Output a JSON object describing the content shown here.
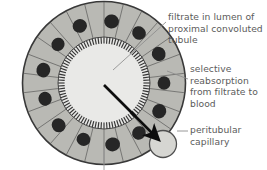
{
  "figure": {
    "type": "biology-diagram",
    "background_color": "#ffffff",
    "text_color": "#5b5b5b"
  },
  "diagram": {
    "tubule": {
      "name": "proximal convoluted tubule",
      "outline_color": "#3c3c3c",
      "cytoplasm_color": "#b9b9b4",
      "nucleus_color": "#2e2e2e",
      "mitochondria_color": "#4a4a4a",
      "center_x": 104,
      "center_y": 83,
      "outer_radius": 82,
      "inner_radius": 46,
      "cell_count": 26,
      "nucleus_count": 13
    },
    "lumen": {
      "name": "lumen",
      "fill_color": "#e8e8e6",
      "radius": 46,
      "brush_border_color": "#2b2b2b",
      "brush_border_ticks": 96
    },
    "capillary": {
      "name": "peritubular capillary",
      "center_x": 163,
      "center_y": 144,
      "radius": 14,
      "fill_color": "#d4d4d0",
      "outline_color": "#555555"
    },
    "arrow": {
      "name": "selective-reabsorption-arrow",
      "color": "#0d0d0d",
      "from_x": 104,
      "from_y": 85,
      "to_x": 160,
      "to_y": 141
    },
    "leaders": [
      {
        "name": "leader-filtrate",
        "color": "#8d8d8d",
        "x1": 166,
        "y1": 22,
        "x2": 113,
        "y2": 70
      },
      {
        "name": "leader-reabsorption",
        "color": "#8d8d8d",
        "x1": 188,
        "y1": 78,
        "x2": 166,
        "y2": 72
      },
      {
        "name": "leader-capillary",
        "color": "#8d8d8d",
        "x1": 188,
        "y1": 131,
        "x2": 178,
        "y2": 131
      },
      {
        "name": "leader-bottom-cutoff",
        "color": "#8d8d8d",
        "x1": 104,
        "y1": 148,
        "x2": 104,
        "y2": 170
      }
    ]
  },
  "labels": {
    "filtrate": "filtrate in lumen of\nproximal  convoluted\ntubule",
    "reabsorption": "selective\nreabsorption\nfrom filtrate to\nblood",
    "capillary": "peritubular\ncapillary"
  }
}
